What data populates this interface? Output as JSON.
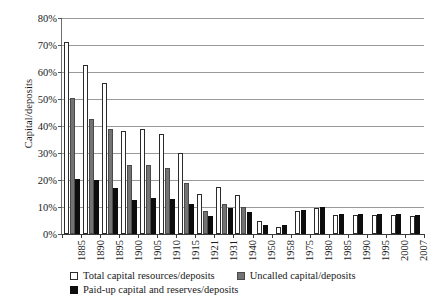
{
  "chart_data": {
    "type": "bar",
    "title": "",
    "xlabel": "",
    "ylabel": "Capital/deposits",
    "ylim": [
      0,
      80
    ],
    "ytick_labels": [
      "0%",
      "10%",
      "20%",
      "30%",
      "40%",
      "50%",
      "60%",
      "70%",
      "80%"
    ],
    "ytick_values": [
      0,
      10,
      20,
      30,
      40,
      50,
      60,
      70,
      80
    ],
    "grid": true,
    "legend_position": "below-plot",
    "categories": [
      "1885",
      "1890",
      "1895",
      "1900",
      "1905",
      "1910",
      "1915",
      "1921",
      "1931",
      "1940",
      "1950",
      "1958",
      "1975",
      "1980",
      "1985",
      "1990",
      "1995",
      "2000",
      "2007"
    ],
    "series": [
      {
        "name": "Total capital resources/deposits",
        "color": "#ffffff",
        "values": [
          71.0,
          62.5,
          56.0,
          38.0,
          39.0,
          37.0,
          30.0,
          15.0,
          17.5,
          14.5,
          5.0,
          2.5,
          8.5,
          9.5,
          7.0,
          7.0,
          7.0,
          7.0,
          6.8
        ]
      },
      {
        "name": "Uncalled capital/deposits",
        "color": "#737373",
        "values": [
          50.5,
          42.5,
          39.0,
          25.5,
          25.5,
          24.5,
          19.0,
          8.7,
          11.0,
          10.0,
          0,
          0,
          0,
          0,
          0,
          0,
          0,
          0,
          0
        ]
      },
      {
        "name": "Paid-up capital and reserves/deposits",
        "color": "#0d0d0d",
        "values": [
          20.5,
          20.0,
          17.0,
          12.5,
          13.5,
          13.0,
          11.0,
          6.5,
          9.5,
          8.0,
          3.5,
          3.5,
          9.0,
          10.0,
          7.5,
          7.5,
          7.5,
          7.5,
          7.2
        ]
      }
    ]
  },
  "legend": {
    "items": [
      {
        "label": "Total capital resources/deposits",
        "swatch": "total"
      },
      {
        "label": "Uncalled capital/deposits",
        "swatch": "uncalled"
      },
      {
        "label": "Paid-up capital and reserves/deposits",
        "swatch": "paidup"
      }
    ]
  }
}
